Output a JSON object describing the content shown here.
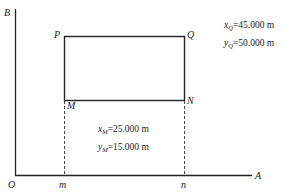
{
  "axes": {
    "vertical_label": "B",
    "horizontal_label": "A",
    "origin_label": "O"
  },
  "points": {
    "P": "P",
    "Q": "Q",
    "M": "M",
    "N": "N",
    "m": "m",
    "n": "n"
  },
  "annotations": {
    "Q": {
      "x_var": "x",
      "x_sub": "Q",
      "x_value": "=45.000 m",
      "y_var": "y",
      "y_sub": "Q",
      "y_value": "=50.000 m"
    },
    "M": {
      "x_var": "x",
      "x_sub": "M",
      "x_value": "=25.000 m",
      "y_var": "y",
      "y_sub": "M",
      "y_value": "=15.000 m"
    }
  }
}
